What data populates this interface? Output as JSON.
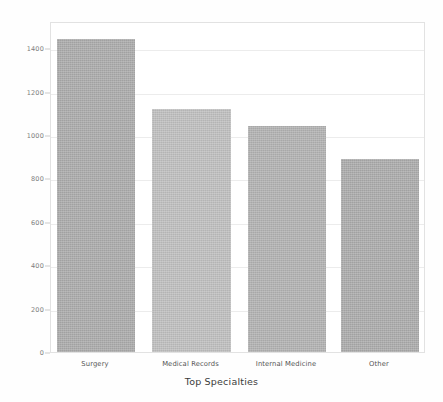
{
  "chart_data": {
    "type": "bar",
    "title": "",
    "xlabel": "Top Specialties",
    "ylabel": "",
    "categories": [
      "Surgery",
      "Medical Records",
      "Internal Medicine",
      "Other"
    ],
    "values": [
      1440,
      1120,
      1040,
      890
    ],
    "ylim": [
      0,
      1525
    ],
    "yticks": [
      0,
      200,
      400,
      600,
      800,
      1000,
      1200,
      1400
    ],
    "ytick_labels": [
      "0",
      "200",
      "400",
      "600",
      "800",
      "1000",
      "1200",
      "1400"
    ],
    "grid": true,
    "legend": "none",
    "bar_colors": [
      "#a9a9a9",
      "#bdbdbd",
      "#b0b0b0",
      "#a9a9a9"
    ],
    "grid_color": "#ececec",
    "frame_color": "#e2e2e2",
    "axis_text_color": "#7d7d7d",
    "title_color": "#3b3b3b",
    "background": "#ffffff"
  },
  "axes": {
    "x_title": "Top Specialties"
  }
}
